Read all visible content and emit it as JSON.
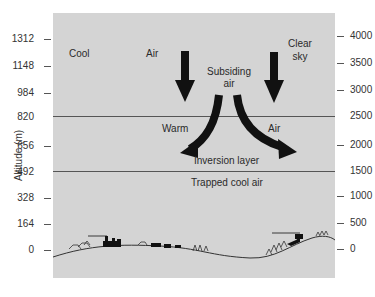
{
  "diagram": {
    "y_axis_left": {
      "label": "Altitude (m)",
      "ticks": [
        "1312",
        "1148",
        "984",
        "820",
        "656",
        "492",
        "328",
        "164",
        "0"
      ]
    },
    "y_axis_right": {
      "ticks": [
        "4000",
        "3500",
        "3000",
        "2500",
        "2000",
        "1500",
        "1000",
        "500",
        "0"
      ]
    },
    "labels": {
      "cool": "Cool",
      "air_top": "Air",
      "subsiding_line1": "Subsiding",
      "subsiding_line2": "air",
      "clear_line1": "Clear",
      "clear_line2": "sky",
      "warm": "Warm",
      "air_mid": "Air",
      "inversion_layer": "Inversion layer",
      "trapped_cool_air": "Trapped cool air"
    },
    "colors": {
      "background": "#d4d4d4",
      "arrow": "#111111",
      "line": "#555555"
    }
  }
}
